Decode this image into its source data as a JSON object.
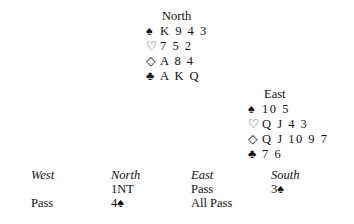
{
  "north": {
    "label": "North",
    "spades": {
      "symbol": "♠",
      "cards": "K 9 4 3"
    },
    "hearts": {
      "symbol": "♡",
      "cards": "7 5 2"
    },
    "diamonds": {
      "symbol": "◇",
      "cards": "A 8 4"
    },
    "clubs": {
      "symbol": "♣",
      "cards": "A K Q"
    }
  },
  "east": {
    "label": "East",
    "spades": {
      "symbol": "♠",
      "cards": "10 5"
    },
    "hearts": {
      "symbol": "♡",
      "cards": "Q J 4 3"
    },
    "diamonds": {
      "symbol": "◇",
      "cards": "Q J 10 9 7"
    },
    "clubs": {
      "symbol": "♣",
      "cards": "7 6"
    }
  },
  "auction": {
    "headers": [
      "West",
      "North",
      "East",
      "South"
    ],
    "rows": [
      [
        "",
        "1NT",
        "Pass",
        "3♠"
      ],
      [
        "Pass",
        "4♠",
        "All Pass",
        ""
      ]
    ]
  }
}
